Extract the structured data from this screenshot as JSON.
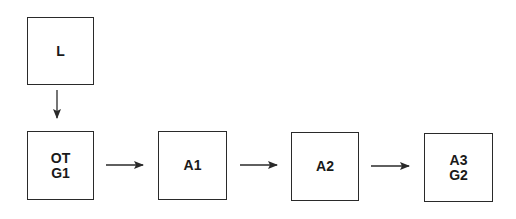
{
  "diagram": {
    "type": "flowchart",
    "nodes": [
      {
        "id": "L",
        "lines": [
          "L"
        ],
        "x": 27,
        "y": 17,
        "w": 67,
        "h": 68
      },
      {
        "id": "OT",
        "lines": [
          "OT",
          "G1"
        ],
        "x": 27,
        "y": 131,
        "w": 67,
        "h": 69
      },
      {
        "id": "A1",
        "lines": [
          "A1"
        ],
        "x": 158,
        "y": 131,
        "w": 69,
        "h": 69
      },
      {
        "id": "A2",
        "lines": [
          "A2"
        ],
        "x": 291,
        "y": 132,
        "w": 68,
        "h": 69
      },
      {
        "id": "A3",
        "lines": [
          "A3",
          "G2"
        ],
        "x": 424,
        "y": 133,
        "w": 69,
        "h": 69
      }
    ],
    "edges": [
      {
        "from": "L",
        "to": "OT",
        "direction": "down"
      },
      {
        "from": "OT",
        "to": "A1",
        "direction": "right"
      },
      {
        "from": "A1",
        "to": "A2",
        "direction": "right"
      },
      {
        "from": "A2",
        "to": "A3",
        "direction": "right"
      }
    ],
    "colors": {
      "stroke": "#2a2a2a",
      "text": "#1a1a1a",
      "background": "#ffffff"
    }
  }
}
